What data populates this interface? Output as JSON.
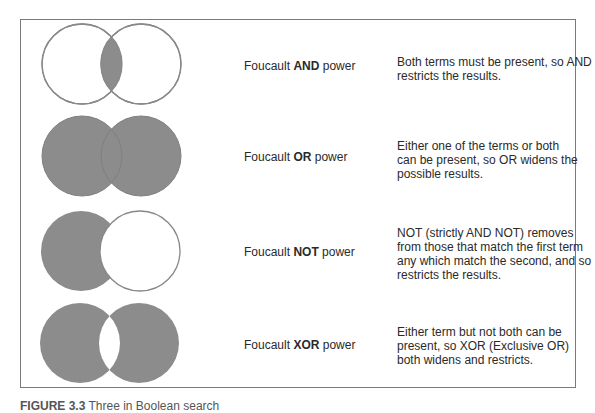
{
  "colors": {
    "fill": "#8c8c8c",
    "stroke": "#888888",
    "frame": "#7a7a7a",
    "text": "#2a2a2a"
  },
  "rows": [
    {
      "operator": "AND",
      "term1": "Foucault",
      "term2": "power",
      "shading": "intersection",
      "description_lines": [
        "Both terms must be present, so AND",
        "restricts the results."
      ]
    },
    {
      "operator": "OR",
      "term1": "Foucault",
      "term2": "power",
      "shading": "union",
      "description_lines": [
        "Either one of the terms or both",
        "can be present, so OR widens the",
        "possible results."
      ]
    },
    {
      "operator": "NOT",
      "term1": "Foucault",
      "term2": "power",
      "shading": "left-minus-right",
      "description_lines": [
        "NOT (strictly AND NOT) removes",
        "from those that match the first term",
        "any which match the second, and so",
        "restricts the results."
      ]
    },
    {
      "operator": "XOR",
      "term1": "Foucault",
      "term2": "power",
      "shading": "symmetric-difference",
      "description_lines": [
        "Either term but not both can be",
        "present, so XOR (Exclusive OR)",
        "both widens and restricts."
      ]
    }
  ],
  "caption": {
    "label": "FIGURE 3.3",
    "text": "Three in Boolean search"
  }
}
